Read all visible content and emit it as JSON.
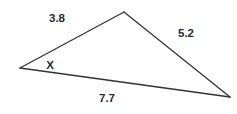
{
  "diagram": {
    "type": "triangle",
    "stroke_color": "#333333",
    "text_color": "#2a2a2a",
    "vertices": {
      "left": {
        "x": 20,
        "y": 68
      },
      "top": {
        "x": 124,
        "y": 12
      },
      "right": {
        "x": 230,
        "y": 97
      }
    },
    "sides": [
      {
        "id": "left-top",
        "label": "3.8",
        "label_pos": {
          "x": 57,
          "y": 22
        }
      },
      {
        "id": "top-right",
        "label": "5.2",
        "label_pos": {
          "x": 186,
          "y": 37
        }
      },
      {
        "id": "left-right",
        "label": "7.7",
        "label_pos": {
          "x": 107,
          "y": 102
        }
      }
    ],
    "angle": {
      "vertex": "left",
      "label": "X",
      "label_pos": {
        "x": 50,
        "y": 69
      }
    }
  }
}
